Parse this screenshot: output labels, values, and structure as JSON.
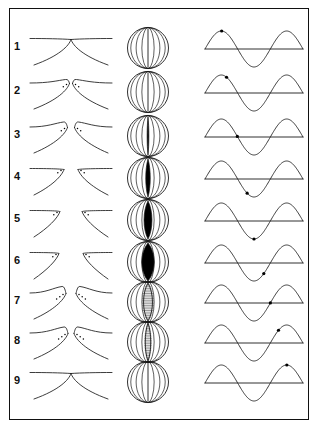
{
  "figure": {
    "frame_color": "#111111",
    "background_color": "#ffffff",
    "stroke_color": "#1a1a1a",
    "fill_color": "#000000",
    "columns": [
      {
        "name": "coronal-section",
        "label": "Coronal cross-section of vocal folds"
      },
      {
        "name": "superior-glottal-view",
        "label": "Superior view of glottis"
      },
      {
        "name": "phase-waveform",
        "label": "Sinusoidal phase marker"
      }
    ],
    "row_labels": [
      "1",
      "2",
      "3",
      "4",
      "5",
      "6",
      "7",
      "8",
      "9"
    ]
  },
  "chart_data": {
    "type": "line",
    "xlabel": "",
    "ylabel": "",
    "xlim": [
      0,
      1
    ],
    "ylim": [
      -1,
      1
    ],
    "grid": false,
    "legend": false,
    "cycles": 1.5,
    "series": [
      {
        "name": "sine wave",
        "equation": "y = sin(2*pi*x*1.5)"
      }
    ],
    "phase_markers": [
      {
        "row": "1",
        "phase_fraction": 0.17,
        "x": 0.17,
        "y": 0.97,
        "description": "near first peak"
      },
      {
        "row": "2",
        "phase_fraction": 0.22,
        "x": 0.22,
        "y": 0.81,
        "description": "descending from first peak"
      },
      {
        "row": "3",
        "phase_fraction": 0.33,
        "x": 0.33,
        "y": 0.0,
        "description": "zero crossing descending"
      },
      {
        "row": "4",
        "phase_fraction": 0.43,
        "x": 0.43,
        "y": -0.81,
        "description": "descending into trough"
      },
      {
        "row": "5",
        "phase_fraction": 0.5,
        "x": 0.5,
        "y": -1.0,
        "description": "trough minimum"
      },
      {
        "row": "6",
        "phase_fraction": 0.6,
        "x": 0.6,
        "y": -0.59,
        "description": "ascending from trough"
      },
      {
        "row": "7",
        "phase_fraction": 0.667,
        "x": 0.667,
        "y": 0.0,
        "description": "zero crossing ascending"
      },
      {
        "row": "8",
        "phase_fraction": 0.75,
        "x": 0.75,
        "y": 0.71,
        "description": "ascending toward second peak"
      },
      {
        "row": "9",
        "phase_fraction": 0.835,
        "x": 0.835,
        "y": 1.0,
        "description": "second peak"
      }
    ]
  },
  "glottis": {
    "description": "Superior view of glottal opening through one vibratory cycle",
    "openings": [
      {
        "row": "1",
        "width": 0.0,
        "state": "closed",
        "shading": "none"
      },
      {
        "row": "2",
        "width": 0.0,
        "state": "closed",
        "shading": "none"
      },
      {
        "row": "3",
        "width": 0.1,
        "state": "opening",
        "shading": "solid"
      },
      {
        "row": "4",
        "width": 0.26,
        "state": "opening",
        "shading": "solid"
      },
      {
        "row": "5",
        "width": 0.46,
        "state": "opening",
        "shading": "solid"
      },
      {
        "row": "6",
        "width": 0.72,
        "state": "maximum-open",
        "shading": "solid"
      },
      {
        "row": "7",
        "width": 0.52,
        "state": "closing",
        "shading": "hatched"
      },
      {
        "row": "8",
        "width": 0.32,
        "state": "closing",
        "shading": "hatched"
      },
      {
        "row": "9",
        "width": 0.0,
        "state": "closed",
        "shading": "none"
      }
    ]
  },
  "coronal": {
    "description": "Coronal section of the vocal folds through one vibratory cycle",
    "stages": [
      {
        "row": "1",
        "state": "closed",
        "marker_dots": 0
      },
      {
        "row": "2",
        "state": "lower-margin-parting",
        "marker_dots": 4
      },
      {
        "row": "3",
        "state": "lower-margin-open",
        "marker_dots": 4
      },
      {
        "row": "4",
        "state": "separating",
        "marker_dots": 4
      },
      {
        "row": "5",
        "state": "open",
        "marker_dots": 4
      },
      {
        "row": "6",
        "state": "maximum-open",
        "marker_dots": 4
      },
      {
        "row": "7",
        "state": "lower-margin-closing",
        "marker_dots": 6
      },
      {
        "row": "8",
        "state": "closing",
        "marker_dots": 6
      },
      {
        "row": "9",
        "state": "closed",
        "marker_dots": 0
      }
    ]
  }
}
